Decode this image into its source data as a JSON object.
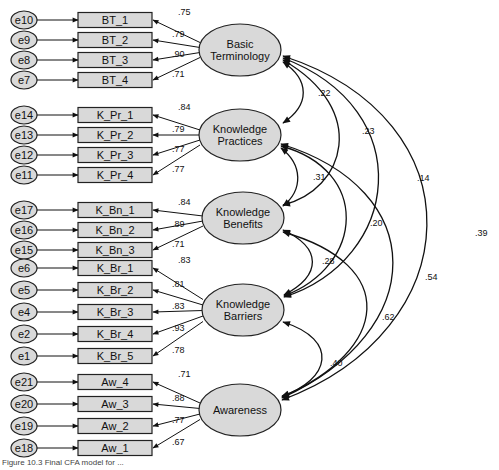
{
  "chart_data": {
    "type": "diagram",
    "title": "Final CFA model",
    "latent_factors": [
      {
        "id": "BT",
        "label_lines": [
          "Basic",
          "Terminology"
        ],
        "indicators": [
          {
            "item": "BT_1",
            "error": "e10",
            "loading": ".75"
          },
          {
            "item": "BT_2",
            "error": "e9",
            "loading": ".79"
          },
          {
            "item": "BT_3",
            "error": "e8",
            "loading": ".90"
          },
          {
            "item": "BT_4",
            "error": "e7",
            "loading": ".71"
          }
        ]
      },
      {
        "id": "KPr",
        "label_lines": [
          "Knowledge",
          "Practices"
        ],
        "indicators": [
          {
            "item": "K_Pr_1",
            "error": "e14",
            "loading": ".84"
          },
          {
            "item": "K_Pr_2",
            "error": "e13",
            "loading": ".79"
          },
          {
            "item": "K_Pr_3",
            "error": "e12",
            "loading": ".77"
          },
          {
            "item": "K_Pr_4",
            "error": "e11",
            "loading": ".77"
          }
        ]
      },
      {
        "id": "KBn",
        "label_lines": [
          "Knowledge",
          "Benefits"
        ],
        "indicators": [
          {
            "item": "K_Bn_1",
            "error": "e17",
            "loading": ".84"
          },
          {
            "item": "K_Bn_2",
            "error": "e16",
            "loading": ".89"
          },
          {
            "item": "K_Bn_3",
            "error": "e15",
            "loading": ".71"
          }
        ]
      },
      {
        "id": "KBr",
        "label_lines": [
          "Knowledge",
          "Barriers"
        ],
        "indicators": [
          {
            "item": "K_Br_1",
            "error": "e6",
            "loading": ".83"
          },
          {
            "item": "K_Br_2",
            "error": "e5",
            "loading": ".81"
          },
          {
            "item": "K_Br_3",
            "error": "e4",
            "loading": ".83"
          },
          {
            "item": "K_Br_4",
            "error": "e2",
            "loading": ".93"
          },
          {
            "item": "K_Br_5",
            "error": "e1",
            "loading": ".78"
          }
        ]
      },
      {
        "id": "Aw",
        "label_lines": [
          "Awareness"
        ],
        "indicators": [
          {
            "item": "Aw_4",
            "error": "e21",
            "loading": ".71"
          },
          {
            "item": "Aw_3",
            "error": "e20",
            "loading": ".88"
          },
          {
            "item": "Aw_2",
            "error": "e19",
            "loading": ".77"
          },
          {
            "item": "Aw_1",
            "error": "e18",
            "loading": ".67"
          }
        ]
      }
    ],
    "correlations": [
      {
        "from": "BT",
        "to": "KPr",
        "value": ".22"
      },
      {
        "from": "BT",
        "to": "KBn",
        "value": ".23"
      },
      {
        "from": "BT",
        "to": "KBr",
        "value": ".14"
      },
      {
        "from": "BT",
        "to": "Aw",
        "value": ".39"
      },
      {
        "from": "KPr",
        "to": "KBn",
        "value": ".31"
      },
      {
        "from": "KPr",
        "to": "KBr",
        "value": ".20"
      },
      {
        "from": "KPr",
        "to": "Aw",
        "value": ".54"
      },
      {
        "from": "KBn",
        "to": "KBr",
        "value": ".28"
      },
      {
        "from": "KBn",
        "to": "Aw",
        "value": ".62"
      },
      {
        "from": "KBr",
        "to": "Aw",
        "value": ".40"
      }
    ]
  },
  "caption": "Figure 10.3 Final CFA model for ..."
}
